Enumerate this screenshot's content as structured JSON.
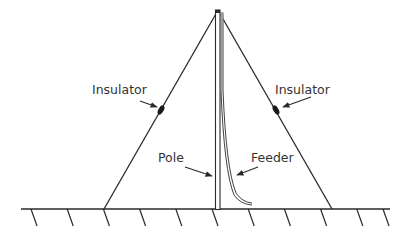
{
  "diagram": {
    "labels": {
      "insulator_left": "Insulator",
      "insulator_right": "Insulator",
      "pole": "Pole",
      "feeder": "Feeder"
    },
    "colors": {
      "line": "#2a2a2a",
      "text": "#333333",
      "background": "#ffffff"
    },
    "ground_hatch_count": 11
  }
}
